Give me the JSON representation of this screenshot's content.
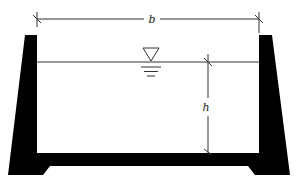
{
  "diagram": {
    "labels": {
      "width": "b",
      "depth": "h"
    },
    "symbols": {
      "water_surface": "water-level-triangle"
    },
    "colors": {
      "structure": "#000000",
      "lines": "#333333",
      "background": "#ffffff"
    }
  }
}
